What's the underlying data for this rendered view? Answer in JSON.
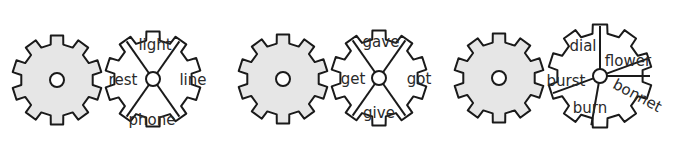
{
  "colors": {
    "gear_fill": "#e6e6e6",
    "stroke": "#1a1a1a",
    "background": "#ffffff"
  },
  "sets": [
    {
      "id": "set-1",
      "plain_gear": {
        "cx": 57,
        "cy": 80,
        "r": 45
      },
      "word_gear": {
        "cx": 153,
        "cy": 79,
        "r": 48,
        "sections": 4,
        "words": [
          {
            "text": "light",
            "x": 155,
            "y": 50
          },
          {
            "text": "line",
            "x": 193,
            "y": 85
          },
          {
            "text": "phone",
            "x": 152,
            "y": 125
          },
          {
            "text": "rest",
            "x": 123,
            "y": 85
          }
        ]
      }
    },
    {
      "id": "set-2",
      "plain_gear": {
        "cx": 283,
        "cy": 79,
        "r": 45
      },
      "word_gear": {
        "cx": 379,
        "cy": 78,
        "r": 48,
        "sections": 4,
        "words": [
          {
            "text": "gave",
            "x": 381,
            "y": 47
          },
          {
            "text": "got",
            "x": 419,
            "y": 84
          },
          {
            "text": "give",
            "x": 379,
            "y": 118
          },
          {
            "text": "get",
            "x": 353,
            "y": 84
          }
        ]
      }
    },
    {
      "id": "set-3",
      "plain_gear": {
        "cx": 499,
        "cy": 78,
        "r": 45
      },
      "word_gear": {
        "cx": 600,
        "cy": 76,
        "r": 52,
        "sections": 5,
        "words": [
          {
            "text": "dial",
            "x": 583,
            "y": 51,
            "rotate": 0
          },
          {
            "text": "flower",
            "x": 628,
            "y": 66,
            "rotate": 0
          },
          {
            "text": "bonnet",
            "x": 635,
            "y": 100,
            "rotate": 28
          },
          {
            "text": "burn",
            "x": 590,
            "y": 113,
            "rotate": 0
          },
          {
            "text": "burst",
            "x": 566,
            "y": 86,
            "rotate": 0
          }
        ]
      }
    }
  ]
}
